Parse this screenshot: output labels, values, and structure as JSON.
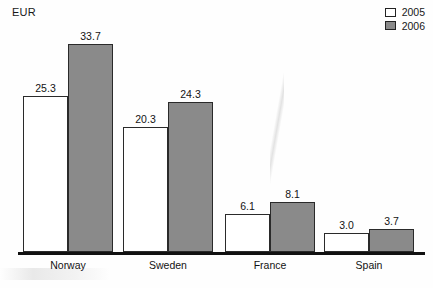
{
  "chart_data": {
    "type": "bar",
    "title": "",
    "subtitle": "",
    "xlabel": "",
    "ylabel": "EUR",
    "unit_label": "EUR",
    "grid": false,
    "legend_position": "top-right",
    "categories": [
      "Norway",
      "Sweden",
      "France",
      "Spain"
    ],
    "series": [
      {
        "name": "2005",
        "color": "#ffffff",
        "values": [
          25.3,
          20.3,
          6.1,
          3.0
        ]
      },
      {
        "name": "2006",
        "color": "#8a8a8a",
        "values": [
          33.7,
          24.3,
          8.1,
          3.7
        ]
      }
    ],
    "value_labels": [
      [
        "25.3",
        "20.3",
        "6.1",
        "3.0"
      ],
      [
        "33.7",
        "24.3",
        "8.1",
        "3.7"
      ]
    ],
    "ylim": [
      0,
      33.7
    ],
    "axis_color": "#111111"
  },
  "legend": {
    "items": [
      {
        "label": "2005",
        "swatch": "white-square-icon"
      },
      {
        "label": "2006",
        "swatch": "gray-square-icon"
      }
    ]
  }
}
